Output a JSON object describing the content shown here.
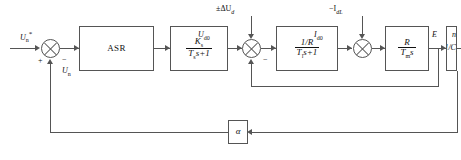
{
  "diagram": {
    "blocks": {
      "asr": "ASR",
      "converter_num": "K",
      "converter_num_sub": "s",
      "converter_den_t": "T",
      "converter_den_sub": "s",
      "converter_den_tail": "s+1",
      "armature_num": "1/R",
      "armature_den_t": "T",
      "armature_den_sub": "l",
      "armature_den_tail": "s+1",
      "mech_num": "R",
      "mech_den_t": "T",
      "mech_den_sub": "m",
      "mech_den_tail": "s",
      "emf": "1/C",
      "emf_sub": "e",
      "feedback": "α"
    },
    "signals": {
      "reference": "U",
      "reference_sub": "n",
      "reference_star": "*",
      "speed_feedback": "U",
      "speed_feedback_sub": "n",
      "converter_out": "U",
      "converter_out_sub": "d0",
      "current": "I",
      "current_sub": "d0",
      "emf_signal": "E",
      "output": "n",
      "disturbance_voltage": "±ΔU",
      "disturbance_voltage_sub": "d",
      "disturbance_load": "−I",
      "disturbance_load_sub": "dL"
    },
    "signs": {
      "sum1_plus": "+",
      "sum1_minus": "−",
      "sum2_minus": "−"
    }
  }
}
